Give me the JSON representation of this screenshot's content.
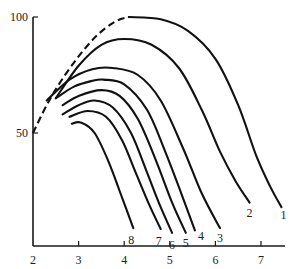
{
  "chart_data": {
    "type": "line",
    "title": "",
    "xlabel": "",
    "ylabel": "",
    "xlim": [
      2,
      7.5
    ],
    "ylim": [
      0,
      100
    ],
    "grid": false,
    "legend": "none (curves labelled at their ends)",
    "x_ticks": [
      2,
      3,
      4,
      5,
      6,
      7
    ],
    "x_tick_labels": [
      "2",
      "3",
      "4",
      "5",
      "6",
      "7"
    ],
    "y_ticks": [
      50,
      100
    ],
    "y_tick_labels": [
      "50",
      "100"
    ],
    "envelope": {
      "name": "envelope (dashed)",
      "style": "dashed",
      "points": [
        [
          2.0,
          50
        ],
        [
          2.3,
          62
        ],
        [
          2.6,
          72
        ],
        [
          3.0,
          83
        ],
        [
          3.4,
          92
        ],
        [
          3.8,
          98
        ],
        [
          4.1,
          100
        ]
      ]
    },
    "series": [
      {
        "name": "1",
        "label": "1",
        "points": [
          [
            4.1,
            100
          ],
          [
            4.8,
            99
          ],
          [
            5.4,
            94
          ],
          [
            6.0,
            82
          ],
          [
            6.5,
            62
          ],
          [
            6.9,
            40
          ],
          [
            7.2,
            27
          ],
          [
            7.45,
            18
          ]
        ]
      },
      {
        "name": "2",
        "label": "2",
        "points": [
          [
            2.5,
            65
          ],
          [
            3.0,
            79
          ],
          [
            3.5,
            88
          ],
          [
            4.0,
            90.5
          ],
          [
            4.6,
            88
          ],
          [
            5.2,
            78
          ],
          [
            5.7,
            60
          ],
          [
            6.1,
            42
          ],
          [
            6.45,
            29
          ],
          [
            6.75,
            20
          ]
        ]
      },
      {
        "name": "3",
        "label": "3",
        "points": [
          [
            2.3,
            64
          ],
          [
            2.8,
            73
          ],
          [
            3.3,
            77.5
          ],
          [
            3.75,
            78
          ],
          [
            4.3,
            75
          ],
          [
            4.8,
            64
          ],
          [
            5.3,
            43
          ],
          [
            5.7,
            24
          ],
          [
            6.1,
            9
          ]
        ]
      },
      {
        "name": "4",
        "label": "4",
        "points": [
          [
            2.5,
            65
          ],
          [
            2.9,
            70
          ],
          [
            3.3,
            72.5
          ],
          [
            3.55,
            73
          ],
          [
            4.0,
            71
          ],
          [
            4.5,
            60
          ],
          [
            4.9,
            42
          ],
          [
            5.25,
            24
          ],
          [
            5.55,
            8
          ]
        ]
      },
      {
        "name": "5",
        "label": "5",
        "points": [
          [
            2.65,
            62
          ],
          [
            3.0,
            66
          ],
          [
            3.5,
            68.5
          ],
          [
            3.9,
            66
          ],
          [
            4.3,
            56
          ],
          [
            4.7,
            38
          ],
          [
            5.05,
            20
          ],
          [
            5.35,
            7
          ]
        ]
      },
      {
        "name": "6",
        "label": "6",
        "points": [
          [
            2.65,
            58
          ],
          [
            3.0,
            62
          ],
          [
            3.35,
            64
          ],
          [
            3.75,
            61
          ],
          [
            4.15,
            50
          ],
          [
            4.5,
            33
          ],
          [
            4.8,
            18
          ],
          [
            5.05,
            7
          ]
        ]
      },
      {
        "name": "7",
        "label": "7",
        "points": [
          [
            2.8,
            57
          ],
          [
            3.2,
            59.5
          ],
          [
            3.6,
            57
          ],
          [
            3.95,
            47
          ],
          [
            4.25,
            33
          ],
          [
            4.55,
            19
          ],
          [
            4.8,
            8.6
          ]
        ]
      },
      {
        "name": "8",
        "label": "8",
        "points": [
          [
            2.85,
            54
          ],
          [
            3.05,
            54.5
          ],
          [
            3.35,
            50
          ],
          [
            3.65,
            38
          ],
          [
            3.9,
            25
          ],
          [
            4.2,
            9
          ]
        ]
      }
    ]
  }
}
